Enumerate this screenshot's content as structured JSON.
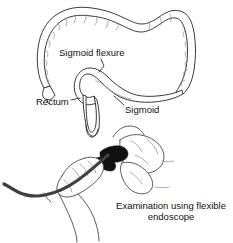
{
  "figure": {
    "kind": "medical-illustration",
    "background_color": "#ffffff",
    "ink_color": "#3a3a3a",
    "width_px": 233,
    "height_px": 243
  },
  "upper_diagram": {
    "name": "colon-diagram",
    "labels": {
      "sigmoid_flexure": "Sigmoid flexure",
      "rectum": "Rectum",
      "sigmoid": "Sigmoid"
    }
  },
  "lower_diagram": {
    "name": "endoscope-examination-diagram",
    "caption_line_1": "Examination using flexible",
    "caption_line_2": "endoscope",
    "scope_color": "#3f3f3f",
    "insertion_color": "#111111"
  }
}
